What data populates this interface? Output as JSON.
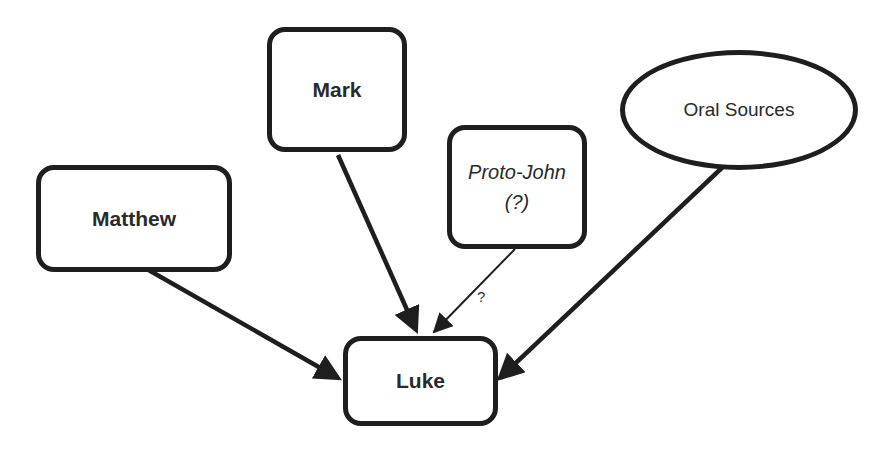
{
  "diagram": {
    "title": "",
    "nodes": {
      "matthew": {
        "label": "Matthew",
        "shape": "rounded-rect"
      },
      "mark": {
        "label": "Mark",
        "shape": "rounded-rect"
      },
      "proto_john": {
        "label_line1": "Proto-John",
        "label_line2": "(?)",
        "shape": "rounded-rect",
        "style": "italic"
      },
      "oral_sources": {
        "label": "Oral Sources",
        "shape": "ellipse"
      },
      "luke": {
        "label": "Luke",
        "shape": "rounded-rect"
      }
    },
    "edges": [
      {
        "from": "Matthew",
        "to": "Luke",
        "style": "thick"
      },
      {
        "from": "Mark",
        "to": "Luke",
        "style": "thick"
      },
      {
        "from": "Proto-John",
        "to": "Luke",
        "style": "thin",
        "label": "?"
      },
      {
        "from": "Oral Sources",
        "to": "Luke",
        "style": "thick"
      }
    ],
    "edge_label_proto_john": "?"
  }
}
